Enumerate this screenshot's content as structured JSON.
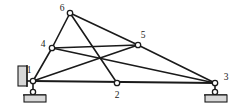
{
  "figure": {
    "width": 237,
    "height": 111,
    "background_color": "#ffffff",
    "line_color": "#1a1a1a",
    "hatch_fill_color": "#d8d8d8"
  },
  "chart_data": {
    "type": "diagram",
    "subtype": "truss-line-diagram",
    "title": "",
    "xlabel": "",
    "ylabel": "",
    "grid": false,
    "legend": null,
    "nodes": [
      {
        "id": "1",
        "label": "1",
        "x": 33,
        "y": 81,
        "label_x": 29,
        "label_y": 71,
        "support": "pin-wall"
      },
      {
        "id": "2",
        "label": "2",
        "x": 117,
        "y": 83,
        "label_x": 117,
        "label_y": 96,
        "support": "none"
      },
      {
        "id": "3",
        "label": "3",
        "x": 215,
        "y": 83,
        "label_x": 226,
        "label_y": 78,
        "support": "roller-ground"
      },
      {
        "id": "4",
        "label": "4",
        "x": 52,
        "y": 48,
        "label_x": 43,
        "label_y": 45,
        "support": "none"
      },
      {
        "id": "5",
        "label": "5",
        "x": 138,
        "y": 45,
        "label_x": 143,
        "label_y": 36,
        "support": "none"
      },
      {
        "id": "6",
        "label": "6",
        "x": 70,
        "y": 13,
        "label_x": 62,
        "label_y": 9,
        "support": "none"
      }
    ],
    "members": [
      {
        "from": "1",
        "to": "4",
        "kind": "web"
      },
      {
        "from": "4",
        "to": "6",
        "kind": "web"
      },
      {
        "from": "6",
        "to": "2",
        "kind": "web"
      },
      {
        "from": "6",
        "to": "5",
        "kind": "web"
      },
      {
        "from": "4",
        "to": "5",
        "kind": "web"
      },
      {
        "from": "4",
        "to": "3",
        "kind": "web"
      },
      {
        "from": "1",
        "to": "5",
        "kind": "web"
      },
      {
        "from": "5",
        "to": "3",
        "kind": "web"
      },
      {
        "from": "1",
        "to": "3",
        "kind": "chord"
      }
    ],
    "supports": [
      {
        "at_node": "1",
        "type": "pin-against-wall",
        "wall_hatch_x": 18,
        "wall_hatch_y": 66,
        "wall_hatch_w": 9,
        "wall_hatch_h": 20,
        "ground_hatch_x": 24,
        "ground_hatch_y": 95,
        "ground_hatch_w": 22,
        "ground_hatch_h": 7,
        "pin_x": 33,
        "pin_y": 92
      },
      {
        "at_node": "3",
        "type": "roller-on-ground",
        "ground_hatch_x": 205,
        "ground_hatch_y": 95,
        "ground_hatch_w": 22,
        "ground_hatch_h": 7,
        "pin_x": 215,
        "pin_y": 92
      }
    ],
    "annotations": []
  }
}
